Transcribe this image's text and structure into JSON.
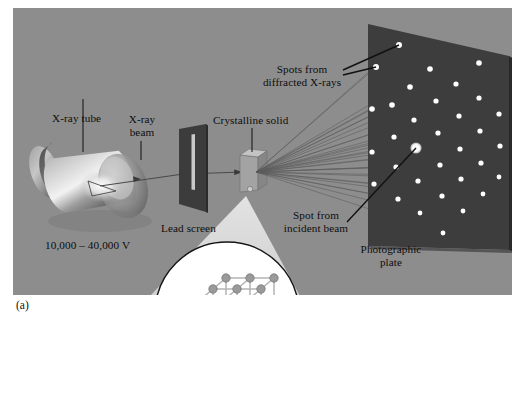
{
  "figure": {
    "panel_label": "(a)",
    "background_color": "#8d8d8d",
    "plate_color": "#3a3a3a",
    "spot_color": "#ffffff"
  },
  "labels": {
    "xray_tube": "X-ray tube",
    "xray_beam_line1": "X-ray",
    "xray_beam_line2": "beam",
    "voltage": "10,000 – 40,000 V",
    "lead_screen": "Lead screen",
    "crystalline_solid": "Crystalline solid",
    "spots_line1": "Spots from",
    "spots_line2": "diffracted X-rays",
    "incident_line1": "Spot from",
    "incident_line2": "incident beam",
    "plate_line1": "Photographic",
    "plate_line2": "plate"
  },
  "chart_data": {
    "type": "scatter",
    "xlabel": "",
    "ylabel": "",
    "note": "White spots recorded on the dark photographic plate; large central spot is the undiffracted incident beam.",
    "spots": [
      {
        "x": 399,
        "y": 45,
        "r": 3.0,
        "kind": "diffracted"
      },
      {
        "x": 376,
        "y": 67,
        "r": 3.0,
        "kind": "diffracted"
      },
      {
        "x": 430,
        "y": 69,
        "r": 2.8,
        "kind": "diffracted"
      },
      {
        "x": 479,
        "y": 63,
        "r": 2.8,
        "kind": "diffracted"
      },
      {
        "x": 410,
        "y": 87,
        "r": 2.8,
        "kind": "diffracted"
      },
      {
        "x": 456,
        "y": 84,
        "r": 2.6,
        "kind": "diffracted"
      },
      {
        "x": 392,
        "y": 105,
        "r": 2.8,
        "kind": "diffracted"
      },
      {
        "x": 436,
        "y": 101,
        "r": 2.6,
        "kind": "diffracted"
      },
      {
        "x": 479,
        "y": 98,
        "r": 2.6,
        "kind": "diffracted"
      },
      {
        "x": 372,
        "y": 109,
        "r": 2.8,
        "kind": "diffracted"
      },
      {
        "x": 414,
        "y": 120,
        "r": 2.6,
        "kind": "diffracted"
      },
      {
        "x": 459,
        "y": 116,
        "r": 2.6,
        "kind": "diffracted"
      },
      {
        "x": 499,
        "y": 114,
        "r": 2.6,
        "kind": "diffracted"
      },
      {
        "x": 394,
        "y": 137,
        "r": 2.6,
        "kind": "diffracted"
      },
      {
        "x": 438,
        "y": 133,
        "r": 2.6,
        "kind": "diffracted"
      },
      {
        "x": 480,
        "y": 131,
        "r": 2.6,
        "kind": "diffracted"
      },
      {
        "x": 372,
        "y": 152,
        "r": 2.6,
        "kind": "diffracted"
      },
      {
        "x": 416,
        "y": 148,
        "r": 5.6,
        "kind": "incident"
      },
      {
        "x": 460,
        "y": 149,
        "r": 2.6,
        "kind": "diffracted"
      },
      {
        "x": 500,
        "y": 146,
        "r": 2.6,
        "kind": "diffracted"
      },
      {
        "x": 396,
        "y": 167,
        "r": 2.6,
        "kind": "diffracted"
      },
      {
        "x": 440,
        "y": 165,
        "r": 2.6,
        "kind": "diffracted"
      },
      {
        "x": 481,
        "y": 163,
        "r": 2.6,
        "kind": "diffracted"
      },
      {
        "x": 374,
        "y": 184,
        "r": 2.6,
        "kind": "diffracted"
      },
      {
        "x": 418,
        "y": 181,
        "r": 2.6,
        "kind": "diffracted"
      },
      {
        "x": 461,
        "y": 179,
        "r": 2.6,
        "kind": "diffracted"
      },
      {
        "x": 499,
        "y": 177,
        "r": 2.4,
        "kind": "diffracted"
      },
      {
        "x": 398,
        "y": 199,
        "r": 2.6,
        "kind": "diffracted"
      },
      {
        "x": 442,
        "y": 196,
        "r": 2.6,
        "kind": "diffracted"
      },
      {
        "x": 483,
        "y": 194,
        "r": 2.4,
        "kind": "diffracted"
      },
      {
        "x": 420,
        "y": 213,
        "r": 2.4,
        "kind": "diffracted"
      },
      {
        "x": 463,
        "y": 211,
        "r": 2.4,
        "kind": "diffracted"
      },
      {
        "x": 443,
        "y": 233,
        "r": 2.4,
        "kind": "diffracted"
      }
    ]
  },
  "lattice": {
    "description": "Cubic crystal lattice, 3x3x3 spheres joined by rods",
    "nx": 3,
    "ny": 3,
    "nz": 3,
    "sphere_color": "#9a9a9a",
    "rod_color": "#b3b3b3"
  }
}
